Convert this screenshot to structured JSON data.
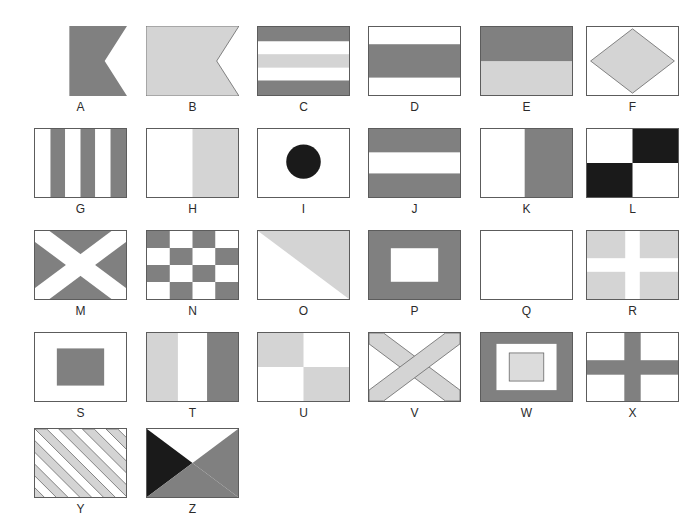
{
  "page": {
    "background_color": "#ffffff",
    "columns": 6,
    "rows": 5,
    "total_flags": 26
  },
  "palette": {
    "dark_gray": "#808080",
    "mid_gray": "#8c8c8c",
    "light_gray": "#d4d4d4",
    "very_light_gray": "#dcdcdc",
    "white": "#ffffff",
    "black": "#1a1a1a",
    "outline": "#5c5c5c",
    "label_text": "#2b2b2b"
  },
  "flags": [
    {
      "label": "A",
      "name": "alfa",
      "shape": "swallowtail",
      "description": "Vertical bicolour, white hoist and gray fly, swallow-tailed",
      "colors": [
        "#ffffff",
        "#808080"
      ]
    },
    {
      "label": "B",
      "name": "bravo",
      "shape": "swallowtail",
      "description": "Solid light gray swallow-tailed pennant",
      "colors": [
        "#d4d4d4"
      ]
    },
    {
      "label": "C",
      "name": "charlie",
      "shape": "rectangle",
      "description": "Five horizontal stripes: gray, white, light gray, white, gray",
      "colors": [
        "#808080",
        "#ffffff",
        "#d4d4d4",
        "#ffffff",
        "#808080"
      ]
    },
    {
      "label": "D",
      "name": "delta",
      "shape": "rectangle",
      "description": "Three horizontal stripes: white, gray, white",
      "colors": [
        "#ffffff",
        "#808080",
        "#ffffff"
      ]
    },
    {
      "label": "E",
      "name": "echo",
      "shape": "rectangle",
      "description": "Two horizontal bands: gray over light gray",
      "colors": [
        "#808080",
        "#d4d4d4"
      ]
    },
    {
      "label": "F",
      "name": "foxtrot",
      "shape": "rectangle",
      "description": "Light gray diamond on white field",
      "colors": [
        "#ffffff",
        "#d4d4d4"
      ]
    },
    {
      "label": "G",
      "name": "golf",
      "shape": "rectangle",
      "description": "Six vertical stripes alternating white and gray",
      "colors": [
        "#ffffff",
        "#808080",
        "#ffffff",
        "#808080",
        "#ffffff",
        "#808080"
      ]
    },
    {
      "label": "H",
      "name": "hotel",
      "shape": "rectangle",
      "description": "Vertical bicolour: white hoist, light gray fly",
      "colors": [
        "#ffffff",
        "#d4d4d4"
      ]
    },
    {
      "label": "I",
      "name": "india",
      "shape": "rectangle",
      "description": "Black circle centred on white field",
      "colors": [
        "#ffffff",
        "#1a1a1a"
      ]
    },
    {
      "label": "J",
      "name": "juliett",
      "shape": "rectangle",
      "description": "Three horizontal stripes: gray, white, gray",
      "colors": [
        "#808080",
        "#ffffff",
        "#808080"
      ]
    },
    {
      "label": "K",
      "name": "kilo",
      "shape": "rectangle",
      "description": "Vertical bicolour: white hoist, gray fly",
      "colors": [
        "#ffffff",
        "#808080"
      ]
    },
    {
      "label": "L",
      "name": "lima",
      "shape": "rectangle",
      "description": "Quartered white and black diagonal checker",
      "colors": [
        "#ffffff",
        "#1a1a1a"
      ]
    },
    {
      "label": "M",
      "name": "mike",
      "shape": "rectangle",
      "description": "White saltire diagonal cross on gray field",
      "colors": [
        "#808080",
        "#ffffff"
      ]
    },
    {
      "label": "N",
      "name": "november",
      "shape": "rectangle",
      "description": "Four-by-four checkerboard of gray and white squares",
      "colors": [
        "#808080",
        "#ffffff"
      ]
    },
    {
      "label": "O",
      "name": "oscar",
      "shape": "rectangle",
      "description": "Diagonally divided: white lower-left, light gray upper-right",
      "colors": [
        "#ffffff",
        "#d4d4d4"
      ]
    },
    {
      "label": "P",
      "name": "papa",
      "shape": "rectangle",
      "description": "Gray field with a white rectangle in the centre",
      "colors": [
        "#808080",
        "#ffffff"
      ]
    },
    {
      "label": "Q",
      "name": "quebec",
      "shape": "rectangle",
      "description": "Plain white field",
      "colors": [
        "#ffffff"
      ]
    },
    {
      "label": "R",
      "name": "romeo",
      "shape": "rectangle",
      "description": "White cross on light gray field",
      "colors": [
        "#d4d4d4",
        "#ffffff"
      ]
    },
    {
      "label": "S",
      "name": "sierra",
      "shape": "rectangle",
      "description": "White field with a gray rectangle in the centre",
      "colors": [
        "#ffffff",
        "#808080"
      ]
    },
    {
      "label": "T",
      "name": "tango",
      "shape": "rectangle",
      "description": "Three vertical stripes: light gray, white, gray",
      "colors": [
        "#d4d4d4",
        "#ffffff",
        "#808080"
      ]
    },
    {
      "label": "U",
      "name": "uniform",
      "shape": "rectangle",
      "description": "Quartered: light gray upper-left and lower-right, white upper-right and lower-left",
      "colors": [
        "#d4d4d4",
        "#ffffff"
      ]
    },
    {
      "label": "V",
      "name": "victor",
      "shape": "rectangle",
      "description": "Light gray saltire diagonal cross on white field",
      "colors": [
        "#ffffff",
        "#d4d4d4"
      ]
    },
    {
      "label": "W",
      "name": "whiskey",
      "shape": "rectangle",
      "description": "Gray border, white band, light gray centre rectangle",
      "colors": [
        "#808080",
        "#ffffff",
        "#d4d4d4"
      ]
    },
    {
      "label": "X",
      "name": "xray",
      "shape": "rectangle",
      "description": "Gray upright cross on white field",
      "colors": [
        "#ffffff",
        "#808080"
      ]
    },
    {
      "label": "Y",
      "name": "yankee",
      "shape": "rectangle",
      "description": "Diagonal stripes alternating light gray and white",
      "colors": [
        "#d4d4d4",
        "#ffffff"
      ]
    },
    {
      "label": "Z",
      "name": "zulu",
      "shape": "rectangle",
      "description": "Four triangles: black hoist, white top, gray fly, gray bottom",
      "colors": [
        "#1a1a1a",
        "#ffffff",
        "#808080"
      ]
    }
  ]
}
